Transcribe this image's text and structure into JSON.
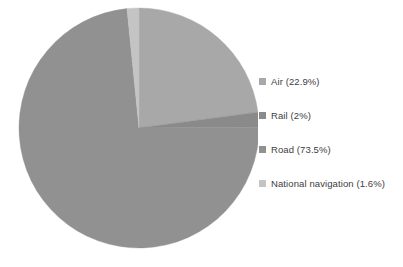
{
  "chart_data": {
    "type": "pie",
    "title": "",
    "subtitle": "",
    "xlabel": "",
    "ylabel": "",
    "grid": false,
    "legend_position": "right",
    "start_angle_deg": 0,
    "direction": "clockwise",
    "categories": [
      "Air",
      "Rail",
      "Road",
      "National navigation"
    ],
    "values": [
      22.9,
      2.0,
      73.5,
      1.6
    ],
    "unit": "%",
    "slices": [
      {
        "label": "Air",
        "value": 22.9,
        "display": "Air (22.9%)",
        "color": "#a8a8a8"
      },
      {
        "label": "Rail",
        "value": 2.0,
        "display": "Rail (2%)",
        "color": "#8a8a8a"
      },
      {
        "label": "Road",
        "value": 73.5,
        "display": "Road (73.5%)",
        "color": "#919191"
      },
      {
        "label": "National navigation",
        "value": 1.6,
        "display": "National navigation (1.6%)",
        "color": "#c4c4c4"
      }
    ]
  },
  "legend": {
    "items": [
      {
        "marker": "legend-swatch-air",
        "label": "Air (22.9%)",
        "color": "#a8a8a8"
      },
      {
        "marker": "legend-swatch-rail",
        "label": "Rail (2%)",
        "color": "#8a8a8a"
      },
      {
        "marker": "legend-swatch-road",
        "label": "Road (73.5%)",
        "color": "#919191"
      },
      {
        "marker": "legend-swatch-national-navigation",
        "label": "National navigation (1.6%)",
        "color": "#c4c4c4"
      }
    ]
  },
  "colors": {
    "background": "#ffffff",
    "text": "#404040",
    "air": "#a8a8a8",
    "rail": "#8a8a8a",
    "road": "#919191",
    "national_navigation": "#c4c4c4"
  },
  "geometry": {
    "center_x": 139,
    "center_y": 128,
    "radius": 120
  }
}
